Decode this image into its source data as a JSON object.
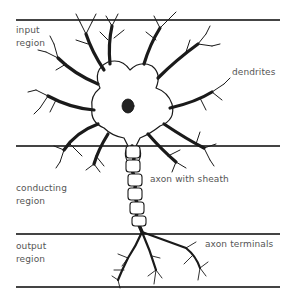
{
  "diagram": {
    "regions": [
      {
        "id": "input",
        "lines": [
          "input",
          "region"
        ],
        "top_rule_y": 19
      },
      {
        "id": "conducting",
        "lines": [
          "conducting",
          "region"
        ],
        "top_rule_y": 145
      },
      {
        "id": "output",
        "lines": [
          "output",
          "region"
        ],
        "top_rule_y": 233
      }
    ],
    "bottom_rule_y": 286,
    "parts": [
      {
        "id": "dendrites",
        "label": "dendrites"
      },
      {
        "id": "axon",
        "label": "axon with sheath"
      },
      {
        "id": "terminals",
        "label": "axon terminals"
      }
    ],
    "colors": {
      "ink": "#1a1a1a",
      "label": "#555555",
      "rule": "#444444",
      "background": "#ffffff"
    }
  }
}
